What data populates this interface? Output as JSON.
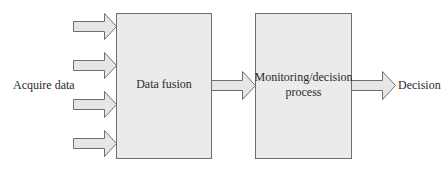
{
  "diagram": {
    "input_label": "Acquire data",
    "boxes": [
      {
        "id": "data-fusion",
        "label": "Data fusion"
      },
      {
        "id": "monitoring",
        "label_line1": "Monitoring/decision",
        "label_line2": "process"
      }
    ],
    "output_label": "Decision",
    "input_arrow_count": 4,
    "colors": {
      "box_fill": "#ebebeb",
      "box_stroke": "#6e6e6e",
      "arrow_fill": "#e6e6e6",
      "arrow_stroke": "#6e6e6e",
      "text": "#2a2a2a"
    }
  }
}
